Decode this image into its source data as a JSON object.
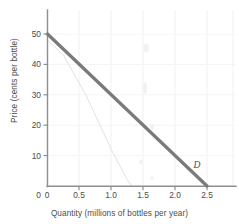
{
  "chart_data": {
    "type": "line",
    "title": "",
    "xlabel": "Quantity (millions of bottles per year)",
    "ylabel": "Price (cents per bottle)",
    "xlim": [
      0,
      2.75
    ],
    "ylim": [
      0,
      57
    ],
    "xticks": [
      0,
      0.5,
      1.0,
      1.5,
      2.0,
      2.5
    ],
    "xticklabels": [
      "0",
      "0.5",
      "1.0",
      "1.5",
      "2.0",
      "2.5"
    ],
    "yticks": [
      0,
      10,
      20,
      30,
      40,
      50
    ],
    "yticklabels": [
      "0",
      "10",
      "20",
      "30",
      "40",
      "50"
    ],
    "grid": "faint",
    "legend_position": "inline-annotation",
    "series": [
      {
        "name": "D",
        "label": "D",
        "kind": "demand-curve",
        "color": "#7a7a7a",
        "linewidth": 3.2,
        "x": [
          0,
          0.5,
          1.0,
          1.5,
          2.0,
          2.5
        ],
        "values": [
          50,
          40,
          30,
          20,
          10,
          0
        ],
        "annotation": {
          "text": "D",
          "x": 2.32,
          "y": 4.5
        }
      },
      {
        "name": "ghost-line",
        "label": "",
        "kind": "scan-bleed-artifact",
        "color": "#e2e2e2",
        "linewidth": 1,
        "x": [
          0,
          0.25,
          0.6,
          1.0,
          1.25,
          1.32
        ],
        "values": [
          48,
          43,
          30,
          12,
          2,
          0
        ]
      }
    ]
  },
  "axis": {
    "x_title": "Quantity (millions of bottles per year)",
    "y_title": "Price (cents per bottle)"
  },
  "ticks": {
    "x": [
      {
        "label": "0",
        "value": 0
      },
      {
        "label": "0.5",
        "value": 0.5
      },
      {
        "label": "1.0",
        "value": 1.0
      },
      {
        "label": "1.5",
        "value": 1.5
      },
      {
        "label": "2.0",
        "value": 2.0
      },
      {
        "label": "2.5",
        "value": 2.5
      }
    ],
    "y": [
      {
        "label": "0",
        "value": 0
      },
      {
        "label": "10",
        "value": 10
      },
      {
        "label": "20",
        "value": 20
      },
      {
        "label": "30",
        "value": 30
      },
      {
        "label": "40",
        "value": 40
      },
      {
        "label": "50",
        "value": 50
      }
    ]
  },
  "curve": {
    "label": "D"
  },
  "colors": {
    "curve": "#7a7a7a",
    "axis": "#8c8c8c",
    "grid": "#f0f0f0",
    "ghost": "#e4e4e4",
    "text": "#4c4c4c",
    "background": "#ffffff"
  }
}
